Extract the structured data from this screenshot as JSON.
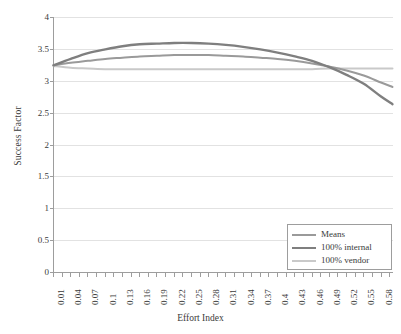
{
  "chart_data": {
    "type": "line",
    "title": "",
    "xlabel": "Effort Index",
    "ylabel": "Success Factor",
    "xlim": [
      0.01,
      0.6
    ],
    "ylim": [
      0,
      4
    ],
    "ytick_values": [
      0,
      0.5,
      1,
      1.5,
      2,
      2.5,
      3,
      3.5,
      4
    ],
    "ytick_labels": [
      "0",
      "0.5",
      "1",
      "1.5",
      "2",
      "2.5",
      "3",
      "3.5",
      "4"
    ],
    "xtick_labels": [
      "0.01",
      "0.04",
      "0.07",
      "0.1",
      "0.13",
      "0.16",
      "0.19",
      "0.22",
      "0.25",
      "0.28",
      "0.31",
      "0.34",
      "0.37",
      "0.4",
      "0.43",
      "0.46",
      "0.49",
      "0.52",
      "0.55",
      "0.58"
    ],
    "x": [
      0.01,
      0.04,
      0.07,
      0.1,
      0.13,
      0.16,
      0.19,
      0.22,
      0.25,
      0.28,
      0.31,
      0.34,
      0.37,
      0.4,
      0.43,
      0.46,
      0.49,
      0.52,
      0.55,
      0.58,
      0.6
    ],
    "grid": "horizontal",
    "legend_position": "bottom-right",
    "series": [
      {
        "name": "Means",
        "color": "#9a9a9a",
        "width": 2.0,
        "values": [
          3.25,
          3.29,
          3.32,
          3.35,
          3.37,
          3.39,
          3.4,
          3.41,
          3.41,
          3.41,
          3.4,
          3.39,
          3.37,
          3.35,
          3.32,
          3.28,
          3.23,
          3.17,
          3.09,
          2.98,
          2.91
        ]
      },
      {
        "name": "100% internal",
        "color": "#7f7f7f",
        "width": 2.4,
        "values": [
          3.25,
          3.35,
          3.44,
          3.5,
          3.55,
          3.58,
          3.59,
          3.6,
          3.6,
          3.59,
          3.57,
          3.54,
          3.5,
          3.45,
          3.39,
          3.32,
          3.22,
          3.1,
          2.96,
          2.76,
          2.64
        ]
      },
      {
        "name": "100% vendor",
        "color": "#c9c9c9",
        "width": 2.0,
        "values": [
          3.24,
          3.21,
          3.2,
          3.19,
          3.19,
          3.19,
          3.19,
          3.19,
          3.19,
          3.19,
          3.19,
          3.19,
          3.19,
          3.19,
          3.19,
          3.19,
          3.2,
          3.2,
          3.2,
          3.2,
          3.2
        ]
      }
    ]
  },
  "axes": {
    "y_title": "Success Factor",
    "x_title": "Effort Index"
  },
  "legend": {
    "items": [
      {
        "label": "Means",
        "color": "#9a9a9a"
      },
      {
        "label": "100% internal",
        "color": "#7f7f7f"
      },
      {
        "label": "100% vendor",
        "color": "#c9c9c9"
      }
    ]
  },
  "colors": {
    "axis": "#9d9d9d",
    "grid": "#e2e2e2",
    "text": "#3a3a3a",
    "background": "#ffffff"
  }
}
